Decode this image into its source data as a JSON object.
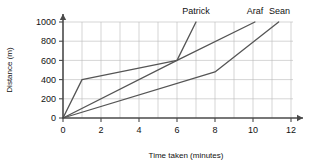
{
  "chart_data": {
    "type": "line",
    "title": "",
    "xlabel": "Time taken (minutes)",
    "ylabel": "Distance (m)",
    "xlim": [
      0,
      12
    ],
    "ylim": [
      0,
      1000
    ],
    "xticks": [
      0,
      2,
      4,
      6,
      8,
      10,
      12
    ],
    "yticks": [
      0,
      200,
      400,
      600,
      800,
      1000
    ],
    "xtick_labels": [
      "0",
      "2",
      "4",
      "6",
      "8",
      "10",
      "12"
    ],
    "ytick_labels": [
      "0",
      "200",
      "400",
      "600",
      "800",
      "1000"
    ],
    "x_gridline_step": 1,
    "y_gridline_step": 200,
    "grid": true,
    "legend_position": "above-line-ends",
    "series": [
      {
        "name": "Patrick",
        "color": "#555555",
        "label_x": 7.0,
        "points": [
          {
            "x": 0,
            "y": 0
          },
          {
            "x": 1,
            "y": 400
          },
          {
            "x": 6,
            "y": 600
          },
          {
            "x": 7,
            "y": 1000
          }
        ]
      },
      {
        "name": "Araf",
        "color": "#555555",
        "label_x": 10.1,
        "points": [
          {
            "x": 0,
            "y": 0
          },
          {
            "x": 6,
            "y": 600
          },
          {
            "x": 10.1,
            "y": 1000
          }
        ]
      },
      {
        "name": "Sean",
        "color": "#555555",
        "label_x": 11.4,
        "points": [
          {
            "x": 0,
            "y": 0
          },
          {
            "x": 8,
            "y": 480
          },
          {
            "x": 11.35,
            "y": 1000
          }
        ]
      }
    ]
  }
}
